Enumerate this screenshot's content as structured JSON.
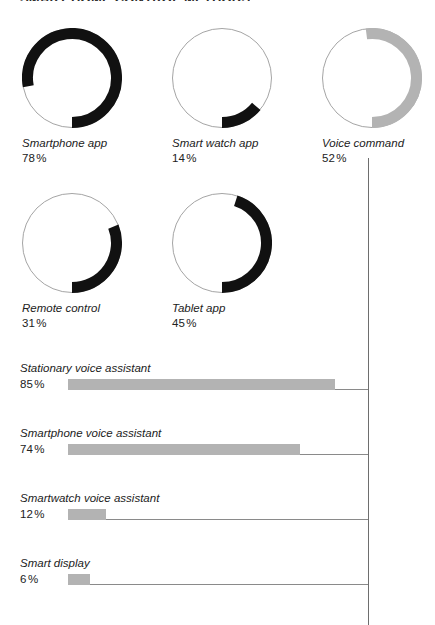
{
  "page": {
    "clipped_heading": "SMART HOME CONTROL METHODS",
    "background_color": "#ffffff",
    "axis_color": "#6e6e6e"
  },
  "colors": {
    "dark": "#111111",
    "gray": "#b3b3b3",
    "ring_track": "#9a9a9a",
    "text": "#222222"
  },
  "chart_data": [
    {
      "type": "pie",
      "title": "Control methods",
      "subtype": "donut-gauge",
      "start_angle_deg": 180,
      "direction": "counterclockwise",
      "unit": "%",
      "items": [
        {
          "label": "Smartphone app",
          "value": 78,
          "value_label": "78",
          "color": "#111111"
        },
        {
          "label": "Smart watch app",
          "value": 14,
          "value_label": "14",
          "color": "#111111"
        },
        {
          "label": "Voice command",
          "value": 52,
          "value_label": "52",
          "color": "#b3b3b3"
        },
        {
          "label": "Remote control",
          "value": 31,
          "value_label": "31",
          "color": "#111111"
        },
        {
          "label": "Tablet app",
          "value": 45,
          "value_label": "45",
          "color": "#111111"
        }
      ]
    },
    {
      "type": "bar",
      "title": "Voice assistant devices",
      "orientation": "horizontal",
      "unit": "%",
      "categories": [
        "Stationary voice assistant",
        "Smartphone voice assistant",
        "Smartwatch voice assistant",
        "Smart display"
      ],
      "values": [
        85,
        74,
        12,
        6
      ],
      "value_labels": [
        "85",
        "74",
        "12",
        "6"
      ],
      "bar_color": "#b3b3b3",
      "xlim": [
        0,
        100
      ],
      "grid": false,
      "legend": false
    }
  ],
  "donuts": [
    {
      "label": "Smartphone app",
      "value_label": "78",
      "pct_symbol": "%",
      "value": 78,
      "color": "#111111"
    },
    {
      "label": "Smart watch app",
      "value_label": "14",
      "pct_symbol": "%",
      "value": 14,
      "color": "#111111"
    },
    {
      "label": "Voice command",
      "value_label": "52",
      "pct_symbol": "%",
      "value": 52,
      "color": "#b3b3b3"
    },
    {
      "label": "Remote control",
      "value_label": "31",
      "pct_symbol": "%",
      "value": 31,
      "color": "#111111"
    },
    {
      "label": "Tablet app",
      "value_label": "45",
      "pct_symbol": "%",
      "value": 45,
      "color": "#111111"
    }
  ],
  "bars": [
    {
      "label": "Stationary voice assistant",
      "value_label": "85",
      "pct_symbol": "%",
      "value": 85
    },
    {
      "label": "Smartphone voice assistant",
      "value_label": "74",
      "pct_symbol": "%",
      "value": 74
    },
    {
      "label": "Smartwatch voice assistant",
      "value_label": "12",
      "pct_symbol": "%",
      "value": 12
    },
    {
      "label": "Smart display",
      "value_label": "6",
      "pct_symbol": "%",
      "value": 6
    }
  ]
}
